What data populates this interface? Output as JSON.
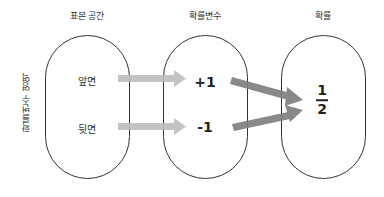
{
  "headers": {
    "sample_space": "표본 공간",
    "random_variable": "확률변수",
    "probability": "확률"
  },
  "side_label": "확률변수 영역",
  "sample_space": {
    "outcomes": [
      "앞면",
      "뒷면"
    ]
  },
  "random_variable": {
    "values": [
      "+1",
      "-1"
    ]
  },
  "probability": {
    "numerator": "1",
    "denominator": "2"
  },
  "colors": {
    "outline": "#333333",
    "light_arrow": "#bdbdbd",
    "dark_arrow": "#7f7f7f",
    "background": "#ffffff"
  }
}
